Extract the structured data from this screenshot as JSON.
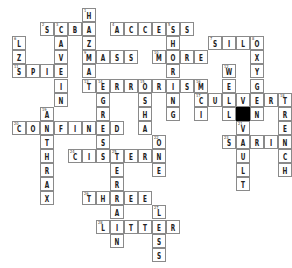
{
  "puzzle": {
    "type": "crossword",
    "grid_origin": {
      "x": 12,
      "y": 8
    },
    "cell_pitch": {
      "x": 14,
      "y": 14.1
    },
    "colors": {
      "cell_bg": "#ffffff",
      "cell_border": "#8a8a8a",
      "block": "#000000",
      "text": "#222222"
    },
    "words": [
      {
        "num": 1,
        "dir": "down",
        "col": 5,
        "row": 0,
        "answer": "HAZMAT"
      },
      {
        "num": 2,
        "dir": "across",
        "col": 2,
        "row": 1,
        "answer": "SCBA"
      },
      {
        "num": 3,
        "dir": "down",
        "col": 3,
        "row": 1,
        "answer": "CAVEIN"
      },
      {
        "num": 4,
        "dir": "across",
        "col": 7,
        "row": 1,
        "answer": "ACCESS"
      },
      {
        "num": 5,
        "dir": "down",
        "col": 11,
        "row": 1,
        "answer": "SHORING"
      },
      {
        "num": 6,
        "dir": "down",
        "col": 0,
        "row": 2,
        "answer": "LZS"
      },
      {
        "num": 7,
        "dir": "across",
        "col": 14,
        "row": 2,
        "answer": "SILO"
      },
      {
        "num": 8,
        "dir": "down",
        "col": 17,
        "row": 2,
        "answer": "OXYGEN"
      },
      {
        "num": 9,
        "dir": "across",
        "col": 5,
        "row": 3,
        "answer": "MASS"
      },
      {
        "num": 10,
        "dir": "across",
        "col": 10,
        "row": 3,
        "answer": "MORE"
      },
      {
        "num": 11,
        "dir": "across",
        "col": 0,
        "row": 4,
        "answer": "SPIE"
      },
      {
        "num": 12,
        "dir": "down",
        "col": 15,
        "row": 4,
        "answer": "WELL"
      },
      {
        "num": 13,
        "dir": "across",
        "col": 5,
        "row": 5,
        "answer": "TERRORISM"
      },
      {
        "num": 14,
        "dir": "down",
        "col": 6,
        "row": 5,
        "answer": "EGRESS"
      },
      {
        "num": 15,
        "dir": "down",
        "col": 9,
        "row": 5,
        "answer": "OSHA"
      },
      {
        "num": 16,
        "dir": "down",
        "col": 13,
        "row": 5,
        "answer": "MCI"
      },
      {
        "num": 17,
        "dir": "across",
        "col": 13,
        "row": 6,
        "answer": "CULVERT"
      },
      {
        "num": 18,
        "dir": "down",
        "col": 19,
        "row": 6,
        "answer": "TRENCH"
      },
      {
        "num": 19,
        "dir": "down",
        "col": 2,
        "row": 7,
        "answer": "ANTHRAX"
      },
      {
        "num": 20,
        "dir": "across",
        "col": 0,
        "row": 8,
        "answer": "CONFINED"
      },
      {
        "num": 21,
        "dir": "down",
        "col": 16,
        "row": 8,
        "answer": "VAULT"
      },
      {
        "num": 22,
        "dir": "down",
        "col": 10,
        "row": 9,
        "answer": "ONE"
      },
      {
        "num": 23,
        "dir": "across",
        "col": 15,
        "row": 9,
        "answer": "SARIN"
      },
      {
        "num": 24,
        "dir": "across",
        "col": 4,
        "row": 10,
        "answer": "CISTERN"
      },
      {
        "num": 25,
        "dir": "down",
        "col": 7,
        "row": 10,
        "answer": "TERRAIN"
      },
      {
        "num": 26,
        "dir": "across",
        "col": 5,
        "row": 13,
        "answer": "THREE"
      },
      {
        "num": 27,
        "dir": "down",
        "col": 10,
        "row": 14,
        "answer": "LESS"
      },
      {
        "num": 28,
        "dir": "across",
        "col": 6,
        "row": 15,
        "answer": "LITTER"
      }
    ],
    "blocks": [
      {
        "col": 16,
        "row": 7
      }
    ],
    "extra_cells": [
      {
        "col": 16,
        "row": 6,
        "letter": "V"
      }
    ]
  }
}
